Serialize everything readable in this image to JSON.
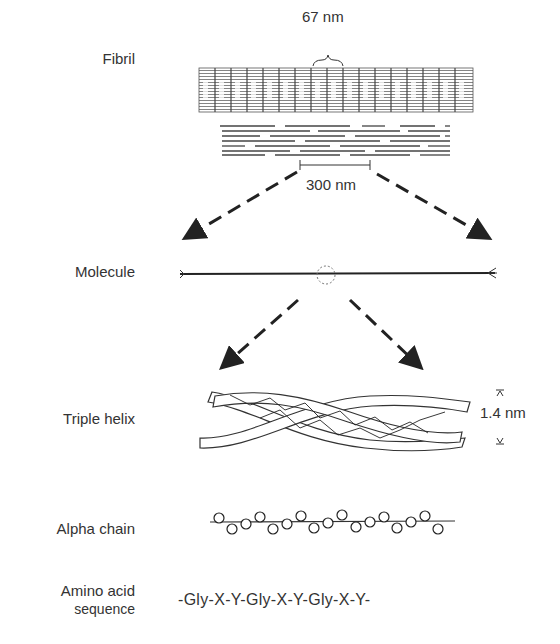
{
  "diagram": {
    "levels": [
      {
        "label": "Fibril"
      },
      {
        "label": "Molecule"
      },
      {
        "label": "Triple helix"
      },
      {
        "label": "Alpha chain"
      },
      {
        "label_line1": "Amino acid",
        "label_line2": "sequence"
      }
    ],
    "annotations": {
      "fibril_period": "67 nm",
      "molecule_length": "300 nm",
      "helix_diameter": "1.4 nm"
    },
    "sequence": "-Gly-X-Y-Gly-X-Y-Gly-X-Y-",
    "colors": {
      "ink": "#2a2a2a",
      "background": "#ffffff"
    }
  }
}
